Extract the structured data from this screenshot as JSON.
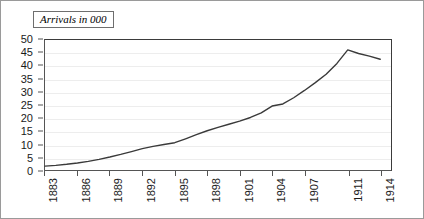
{
  "title": {
    "text": "Arrivals in 000"
  },
  "chart_data": {
    "type": "line",
    "title": "Arrivals in 000",
    "xlabel": "",
    "ylabel": "",
    "xlim": [
      1883,
      1915
    ],
    "ylim": [
      0,
      50
    ],
    "grid": true,
    "legend": false,
    "y_ticks": [
      0,
      5,
      10,
      15,
      20,
      25,
      30,
      35,
      40,
      45,
      50
    ],
    "y_tick_labels": [
      "0",
      "5",
      "10",
      "15",
      "20",
      "25",
      "30",
      "35",
      "40",
      "45",
      "50"
    ],
    "x_ticks": [
      1883,
      1886,
      1889,
      1892,
      1895,
      1898,
      1901,
      1904,
      1907,
      1911,
      1914
    ],
    "x_tick_labels": [
      "1883",
      "1886",
      "1889",
      "1892",
      "1895",
      "1898",
      "1901",
      "1904",
      "1907",
      "1911",
      "1914"
    ],
    "series": [
      {
        "name": "Arrivals",
        "color": "#3a3a3a",
        "x": [
          1883,
          1884,
          1885,
          1886,
          1887,
          1888,
          1889,
          1890,
          1891,
          1892,
          1893,
          1894,
          1895,
          1896,
          1897,
          1898,
          1899,
          1900,
          1901,
          1902,
          1903,
          1904,
          1905,
          1906,
          1907,
          1908,
          1909,
          1910,
          1911,
          1912,
          1913,
          1914
        ],
        "values": [
          1.5,
          1.8,
          2.2,
          2.7,
          3.3,
          4.1,
          5.0,
          6.0,
          7.1,
          8.2,
          9.1,
          9.8,
          10.5,
          12.0,
          13.6,
          15.1,
          16.4,
          17.6,
          18.8,
          20.2,
          22.0,
          24.6,
          25.4,
          27.8,
          30.6,
          33.6,
          36.8,
          41.0,
          46.2,
          44.8,
          43.8,
          42.6
        ]
      }
    ]
  }
}
